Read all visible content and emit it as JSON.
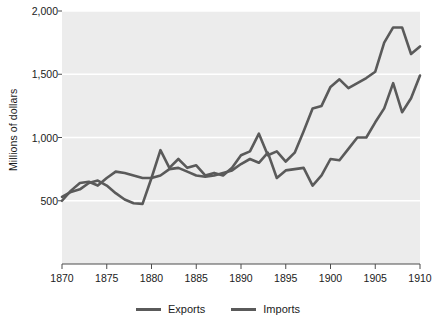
{
  "chart_data": {
    "type": "line",
    "title": "",
    "subtitle": "",
    "xlabel": "",
    "ylabel": "Millions of dollars",
    "xlim": [
      1870,
      1910
    ],
    "ylim": [
      0,
      2000
    ],
    "xticks": [
      1870,
      1875,
      1880,
      1885,
      1890,
      1895,
      1900,
      1905,
      1910
    ],
    "xtick_labels": [
      "1870",
      "1875",
      "1880",
      "1885",
      "1890",
      "1895",
      "1900",
      "1905",
      "1910"
    ],
    "yticks": [
      500,
      1000,
      1500,
      2000
    ],
    "ytick_labels": [
      "500",
      "1,000",
      "1,500",
      "2,000"
    ],
    "grid": "horizontal",
    "grid_color": "#ffffff",
    "plot_background": "#ececec",
    "legend_position": "bottom",
    "line_color": "#5a5a5a",
    "x": [
      1870,
      1871,
      1872,
      1873,
      1874,
      1875,
      1876,
      1877,
      1878,
      1879,
      1880,
      1881,
      1882,
      1883,
      1884,
      1885,
      1886,
      1887,
      1888,
      1889,
      1890,
      1891,
      1892,
      1893,
      1894,
      1895,
      1896,
      1897,
      1898,
      1899,
      1900,
      1901,
      1902,
      1903,
      1904,
      1905,
      1906,
      1907,
      1908,
      1909,
      1910
    ],
    "series": [
      {
        "name": "Exports",
        "values": [
          530,
          570,
          590,
          640,
          660,
          620,
          560,
          510,
          480,
          475,
          680,
          900,
          760,
          830,
          760,
          780,
          700,
          720,
          700,
          760,
          860,
          890,
          1030,
          860,
          890,
          810,
          880,
          1050,
          1230,
          1250,
          1400,
          1460,
          1390,
          1430,
          1470,
          1520,
          1750,
          1870,
          1870,
          1660,
          1720
        ]
      },
      {
        "name": "Imports",
        "values": [
          500,
          580,
          640,
          650,
          620,
          680,
          730,
          720,
          700,
          680,
          680,
          700,
          750,
          760,
          730,
          700,
          690,
          700,
          720,
          740,
          790,
          830,
          800,
          880,
          680,
          740,
          750,
          760,
          620,
          700,
          830,
          820,
          910,
          1000,
          1000,
          1120,
          1230,
          1430,
          1200,
          1310,
          1490
        ]
      }
    ]
  },
  "legend": {
    "items": [
      {
        "label": "Exports",
        "color": "#5a5a5a"
      },
      {
        "label": "Imports",
        "color": "#5a5a5a"
      }
    ]
  }
}
